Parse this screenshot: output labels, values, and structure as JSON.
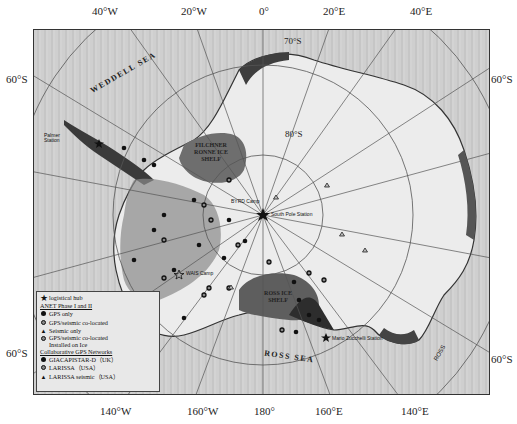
{
  "map": {
    "top_longitude_ticks": [
      "40°W",
      "20°W",
      "0°",
      "20°E",
      "40°E"
    ],
    "bottom_longitude_ticks": [
      "140°W",
      "160°W",
      "180°",
      "160°E",
      "140°E"
    ],
    "left_latitude_ticks": [
      "60°S",
      "60°S"
    ],
    "right_latitude_ticks": [
      "60°S",
      "60°S"
    ],
    "inner_latitude_labels": [
      "70°S",
      "80°S"
    ],
    "sea_labels": {
      "weddell": "WEDDELL SEA",
      "ross": "ROSS SEA"
    },
    "ice_shelves": {
      "filchner_ronne": "FILCHNER RONNE ICE SHELF",
      "ross": "ROSS ICE SHELF"
    },
    "stations": {
      "south_pole": "South Pole Station",
      "palmer": "Palmer Station",
      "mario_zucchelli": "Mario Zucchelli Station",
      "wais_camp": "WAIS Camp",
      "byrd_camp": "BYRD Camp",
      "ross_label": "ROSS"
    },
    "colors": {
      "frame_bg": "#cdcdcd",
      "land_light": "#ececec",
      "land_dark": "#444444",
      "shelf": "#6e6e6e",
      "grid": "#555555"
    }
  },
  "legend": {
    "logistical_hub": "logistical hub",
    "anet_header": "ANET Phase I and II",
    "gps_only": "GPS only",
    "gps_seismic": "GPS/seismic co-located",
    "seismic_only": "Seismic only",
    "gps_seismic_ice_1": "GPS/seismic co-located",
    "gps_seismic_ice_2": "Installed on Ice",
    "collab_header": "Collaborative GPS Networks",
    "giacapistar": "GIACAPISTAR-D（UK）",
    "larissa": "LARISSA（USA）",
    "larissa_seismic": "LARISSA seismic（USA）"
  }
}
